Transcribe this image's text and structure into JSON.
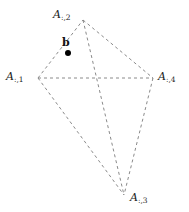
{
  "figure": {
    "type": "diagram",
    "kind": "convex-hull-dashed-quadrilateral",
    "width": 189,
    "height": 212,
    "background_color": "#ffffff",
    "line_color": "#8a8a8a",
    "line_style": "dashed",
    "line_width": 1,
    "dash_pattern": "3 3",
    "text_color": "#1a1a1a",
    "point_color": "#000000"
  },
  "vertices": [
    {
      "id": "A1",
      "base": "A",
      "subscript": ":,1",
      "label": "A:,1",
      "x": 38,
      "y": 78,
      "label_x": 6,
      "label_y": 71,
      "label_anchor": "left"
    },
    {
      "id": "A2",
      "base": "A",
      "subscript": ":,2",
      "label": "A:,2",
      "x": 83,
      "y": 20,
      "label_x": 53,
      "label_y": 9,
      "label_anchor": "left"
    },
    {
      "id": "A3",
      "base": "A",
      "subscript": ":,3",
      "label": "A:,3",
      "x": 124,
      "y": 195,
      "label_x": 130,
      "label_y": 192,
      "label_anchor": "left"
    },
    {
      "id": "A4",
      "base": "A",
      "subscript": ":,4",
      "label": "A:,4",
      "x": 153,
      "y": 78,
      "label_x": 158,
      "label_y": 71,
      "label_anchor": "left"
    }
  ],
  "edges": [
    {
      "id": "edge-A1-A2",
      "from": "A1",
      "to": "A2"
    },
    {
      "id": "edge-A2-A4",
      "from": "A2",
      "to": "A4"
    },
    {
      "id": "edge-A1-A4",
      "from": "A1",
      "to": "A4"
    },
    {
      "id": "edge-A1-A3",
      "from": "A1",
      "to": "A3"
    },
    {
      "id": "edge-A2-A3",
      "from": "A2",
      "to": "A3"
    },
    {
      "id": "edge-A4-A3",
      "from": "A4",
      "to": "A3"
    }
  ],
  "points": [
    {
      "id": "b",
      "label": "b",
      "x": 68,
      "y": 53,
      "radius": 3,
      "label_x": 62,
      "label_y": 37
    }
  ]
}
